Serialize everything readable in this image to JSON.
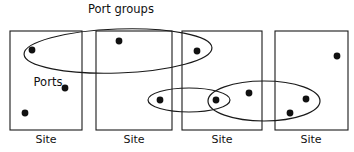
{
  "diagram": {
    "type": "venn-set-diagram",
    "canvas": {
      "width": 354,
      "height": 152,
      "background": "#ffffff"
    },
    "stroke_color": "#1a1a1a",
    "dot_color": "#111111",
    "labels": {
      "port_groups": "Port groups",
      "ports": "Ports"
    },
    "annotations": [
      {
        "name": "port-groups-callout",
        "text": "Port groups",
        "x": 121,
        "y": 13
      },
      {
        "name": "ports-callout",
        "text": "Ports",
        "x": 48,
        "y": 86
      }
    ],
    "sites": [
      {
        "id": "site-1",
        "label": "Site",
        "x": 10,
        "y": 31,
        "width": 72,
        "height": 99,
        "label_x": 46,
        "label_y": 143
      },
      {
        "id": "site-2",
        "label": "Site",
        "x": 96,
        "y": 31,
        "width": 76,
        "height": 99,
        "label_x": 134,
        "label_y": 143
      },
      {
        "id": "site-3",
        "label": "Site",
        "x": 182,
        "y": 31,
        "width": 80,
        "height": 99,
        "label_x": 222,
        "label_y": 143
      },
      {
        "id": "site-4",
        "label": "Site",
        "x": 275,
        "y": 31,
        "width": 73,
        "height": 99,
        "label_x": 311,
        "label_y": 143
      }
    ],
    "port_groups": [
      {
        "id": "port-group-top",
        "cx": 118,
        "cy": 51,
        "rx": 94,
        "ry": 22,
        "rotation": -2
      },
      {
        "id": "port-group-small",
        "cx": 189,
        "cy": 100,
        "rx": 41,
        "ry": 12,
        "rotation": 0
      },
      {
        "id": "port-group-right",
        "cx": 264,
        "cy": 101,
        "rx": 56,
        "ry": 20,
        "rotation": 0
      }
    ],
    "ports": [
      {
        "id": "port-1",
        "cx": 32,
        "cy": 50,
        "r": 3.4,
        "site": "site-1"
      },
      {
        "id": "port-2",
        "cx": 65,
        "cy": 88,
        "r": 3.4,
        "site": "site-1"
      },
      {
        "id": "port-3",
        "cx": 25,
        "cy": 113,
        "r": 3.4,
        "site": "site-1"
      },
      {
        "id": "port-4",
        "cx": 119,
        "cy": 41,
        "r": 3.4,
        "site": "site-2"
      },
      {
        "id": "port-5",
        "cx": 160,
        "cy": 100,
        "r": 3.4,
        "site": "site-2"
      },
      {
        "id": "port-6",
        "cx": 197,
        "cy": 51,
        "r": 3.4,
        "site": "site-3"
      },
      {
        "id": "port-7",
        "cx": 216,
        "cy": 100,
        "r": 3.4,
        "site": "site-3"
      },
      {
        "id": "port-8",
        "cx": 249,
        "cy": 93,
        "r": 3.4,
        "site": "site-3"
      },
      {
        "id": "port-9",
        "cx": 337,
        "cy": 56,
        "r": 3.4,
        "site": "site-4"
      },
      {
        "id": "port-10",
        "cx": 306,
        "cy": 99,
        "r": 3.4,
        "site": "site-4"
      },
      {
        "id": "port-11",
        "cx": 290,
        "cy": 113,
        "r": 3.4,
        "site": "site-4"
      }
    ]
  }
}
